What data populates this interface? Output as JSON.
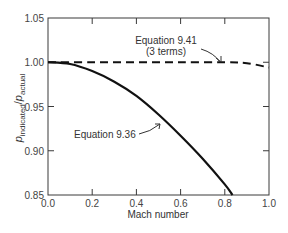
{
  "chart_data": {
    "type": "line",
    "title": "",
    "xlabel": "Mach number",
    "ylabel": "p_indicated / p_actual",
    "ylabel_parts": {
      "p": "p",
      "sub1": "indicated",
      "slash": "/",
      "p2": "p",
      "sub2": "actual"
    },
    "xlim": [
      0.0,
      1.0
    ],
    "ylim": [
      0.85,
      1.05
    ],
    "x_ticks": [
      "0.0",
      "0.2",
      "0.4",
      "0.6",
      "0.8",
      "1.0"
    ],
    "y_ticks": [
      "0.85",
      "0.90",
      "0.95",
      "1.00",
      "1.05"
    ],
    "grid": false,
    "series": [
      {
        "name": "Equation 9.36",
        "style": "solid",
        "x": [
          0.0,
          0.1,
          0.2,
          0.3,
          0.4,
          0.5,
          0.6,
          0.7,
          0.8,
          0.835
        ],
        "y": [
          1.0,
          0.998,
          0.99,
          0.978,
          0.962,
          0.941,
          0.917,
          0.891,
          0.862,
          0.85
        ]
      },
      {
        "name": "Equation 9.41 (3 terms)",
        "style": "dashed",
        "x": [
          0.0,
          0.2,
          0.4,
          0.6,
          0.8,
          0.9,
          1.0
        ],
        "y": [
          1.0,
          1.0,
          1.0,
          1.0,
          1.0,
          0.999,
          0.994
        ]
      }
    ],
    "annotations": [
      {
        "text": "Equation 9.41",
        "text2": "(3 terms)",
        "points_to_series": "Equation 9.41 (3 terms)"
      },
      {
        "text": "Equation 9.36",
        "points_to_series": "Equation 9.36"
      }
    ]
  }
}
